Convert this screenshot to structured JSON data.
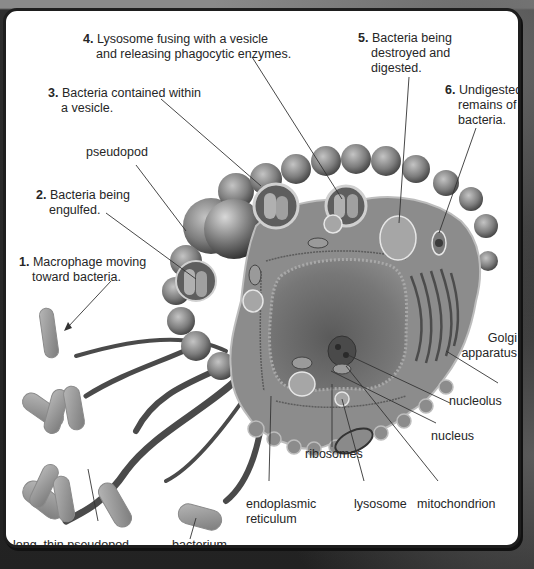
{
  "diagram": {
    "colors": {
      "panel_background": "#ffffff",
      "cell_body": "#8c8c8c",
      "cell_body_dark": "#5e5e5e",
      "nucleus": "#6d6d6d",
      "bacteria": "#9a9a9a",
      "label_text": "#262626",
      "leader_lines": "#333333",
      "frame": "#1e1e1e"
    },
    "step_labels": [
      {
        "num": "1.",
        "line1": "Macrophage moving",
        "line2": "toward bacteria."
      },
      {
        "num": "2.",
        "line1": "Bacteria being",
        "line2": "engulfed."
      },
      {
        "num": "3.",
        "line1": "Bacteria contained within",
        "line2": "a vesicle."
      },
      {
        "num": "4.",
        "line1": "Lysosome fusing with a vesicle",
        "line2": "and releasing phagocytic enzymes."
      },
      {
        "num": "5.",
        "line1": "Bacteria being",
        "line2": "destroyed and",
        "line3": "digested."
      },
      {
        "num": "6.",
        "line1": "Undigested",
        "line2": "remains of",
        "line3": "bacteria."
      }
    ],
    "structure_labels": {
      "pseudopod": "pseudopod",
      "golgi_line1": "Golgi",
      "golgi_line2": "apparatus",
      "nucleolus": "nucleolus",
      "nucleus": "nucleus",
      "ribosomes": "ribosomes",
      "er_line1": "endoplasmic",
      "er_line2": "reticulum",
      "lysosome": "lysosome",
      "mitochondrion": "mitochondrion",
      "long_pseudopod": "long, thin pseudopod",
      "bacterium": "bacterium"
    }
  }
}
